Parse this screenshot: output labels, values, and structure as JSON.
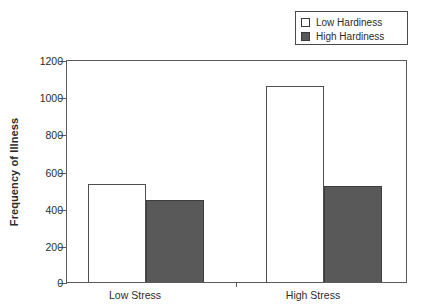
{
  "chart_data": {
    "type": "bar",
    "title": "",
    "xlabel": "",
    "ylabel": "Frequency of Illness",
    "categories": [
      "Low Stress",
      "High Stress"
    ],
    "series": [
      {
        "name": "Low Hardiness",
        "color": "#ffffff",
        "values": [
          530,
          1055
        ]
      },
      {
        "name": "High Hardiness",
        "color": "#595959",
        "values": [
          440,
          515
        ]
      }
    ],
    "ylim": [
      0,
      1200
    ],
    "yticks": [
      0,
      200,
      400,
      600,
      800,
      1000,
      1200
    ],
    "ytick_labels": [
      "0",
      "200",
      "400",
      "600",
      "800",
      "1000",
      "1200"
    ],
    "grid": false,
    "legend_position": "top-right",
    "frame": "box"
  },
  "legend": {
    "items": [
      {
        "label": "Low Hardiness",
        "swatch": "open-square-swatch"
      },
      {
        "label": "High Hardiness",
        "swatch": "filled-square-swatch"
      }
    ]
  },
  "axes": {
    "y_title": "Frequency of Illness",
    "y_labels": [
      "1200",
      "1000",
      "800",
      "600",
      "400",
      "200",
      "0"
    ],
    "x_labels": [
      "Low Stress",
      "High Stress"
    ]
  },
  "colors": {
    "low_hardiness_fill": "#ffffff",
    "high_hardiness_fill": "#595959",
    "axis": "#5a5a5a",
    "text": "#2b2b2b",
    "background": "#ffffff"
  }
}
